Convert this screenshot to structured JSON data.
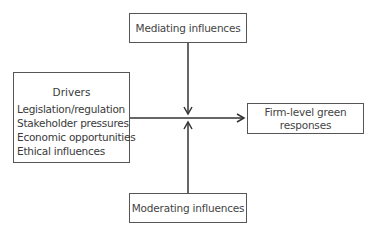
{
  "diagram": {
    "mediating": {
      "label": "Mediating influences"
    },
    "moderating": {
      "label": "Moderating influences"
    },
    "drivers": {
      "title": "Drivers",
      "items": [
        "Legislation/regulation",
        "Stakeholder pressures",
        "Economic opportunities",
        "Ethical influences"
      ]
    },
    "outcome": {
      "line1": "Firm-level green",
      "line2": "responses"
    },
    "colors": {
      "line": "#333333",
      "border": "#555555",
      "text": "#444444"
    }
  }
}
